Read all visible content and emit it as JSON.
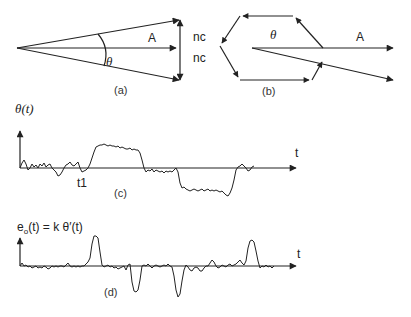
{
  "panel_a": {
    "caption": "(a)",
    "vector_label": "A",
    "angle_label": "θ",
    "noise_label_top": "nc",
    "noise_label_bottom": "nc"
  },
  "panel_b": {
    "caption": "(b)",
    "vector_label": "A",
    "angle_label": "θ"
  },
  "panel_c": {
    "caption": "(c)",
    "y_label": "θ(t)",
    "x_label": "t",
    "marker_label": "t1"
  },
  "panel_d": {
    "caption": "(d)",
    "y_label_main": "e",
    "y_label_sub": "o",
    "y_label_rest": "(t) = k θ′(t)",
    "x_label": "t"
  },
  "colors": {
    "ink": "#222222",
    "background": "#ffffff"
  }
}
